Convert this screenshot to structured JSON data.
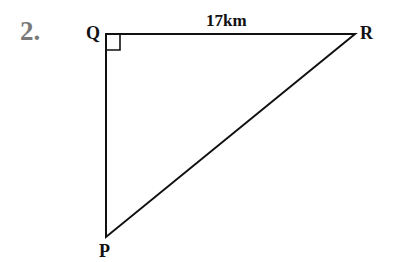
{
  "question": {
    "number": "2."
  },
  "diagram": {
    "type": "right-triangle",
    "vertices": {
      "Q": {
        "label": "Q",
        "x": 106,
        "y": 34
      },
      "R": {
        "label": "R",
        "x": 355,
        "y": 34
      },
      "P": {
        "label": "P",
        "x": 106,
        "y": 237
      }
    },
    "right_angle_at": "Q",
    "side_labels": {
      "QR": "17km"
    },
    "line_color": "#111111"
  }
}
